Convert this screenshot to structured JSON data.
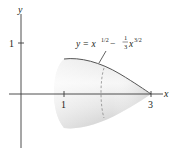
{
  "figure": {
    "axes": {
      "x_label": "x",
      "y_label": "y",
      "x_ticks": [
        {
          "value": 1,
          "label": "1"
        },
        {
          "value": 3,
          "label": "3"
        }
      ],
      "y_ticks": [
        {
          "value": 1,
          "label": "1"
        }
      ]
    },
    "curve_label": {
      "prefix": "y = x",
      "exp1": "1/2",
      "minus": " − ",
      "frac_num": "1",
      "frac_den": "3",
      "x2": "x",
      "exp2": "3/2"
    },
    "interval": {
      "start": 1,
      "end": 3
    },
    "colors": {
      "axis": "#3a3a3a",
      "surface_light": "#f2f2f2",
      "surface_dark": "#cfcfcf",
      "outline": "#555555",
      "dashed": "#8a8a8a"
    }
  }
}
